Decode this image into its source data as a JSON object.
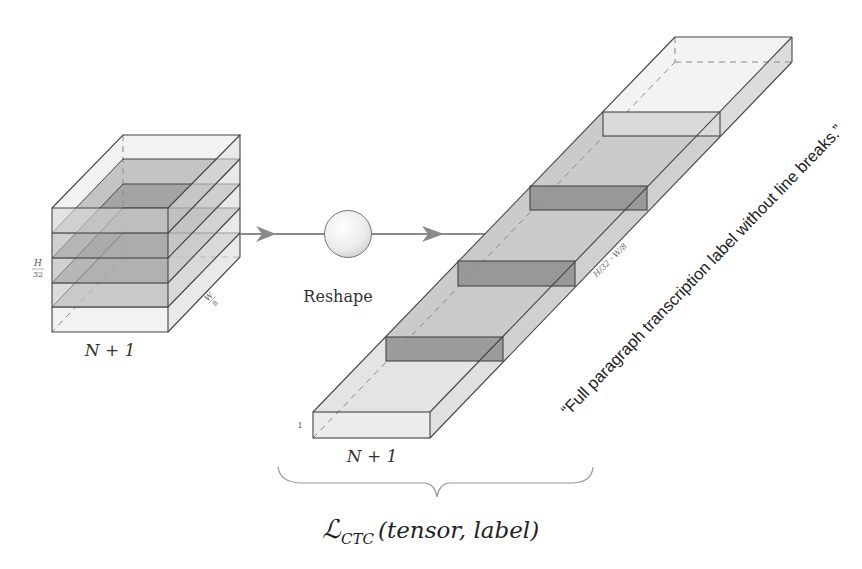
{
  "diagram": {
    "input_tensor": {
      "label_width": "N + 1",
      "label_height_num": "H",
      "label_height_den": "32",
      "label_depth_num": "W",
      "label_depth_den": "8"
    },
    "operation": {
      "label": "Reshape"
    },
    "output_tensor": {
      "label_width": "N + 1",
      "label_height": "1",
      "label_length": "H/32 · W/8"
    },
    "annotation": {
      "text": "“Full paragraph transcription label without line breaks.”"
    },
    "loss": {
      "symbol": "ℒ",
      "subscript": "CTC",
      "args": "(tensor, label)"
    },
    "colors": {
      "edge": "#444444",
      "light_fill": "#e6e6e6",
      "mid_fill": "#bdbdbd",
      "dark_fill": "#8f8f8f",
      "arrow": "#8a8a8a"
    }
  }
}
